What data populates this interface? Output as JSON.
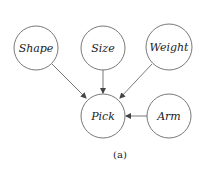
{
  "diagram": {
    "type": "bayesian-network",
    "nodes": [
      {
        "id": "shape",
        "label": "Shape",
        "cx": 36,
        "cy": 48,
        "r": 22
      },
      {
        "id": "size",
        "label": "Size",
        "cx": 103,
        "cy": 48,
        "r": 22
      },
      {
        "id": "weight",
        "label": "Weight",
        "cx": 169,
        "cy": 47,
        "r": 23
      },
      {
        "id": "pick",
        "label": "Pick",
        "cx": 103,
        "cy": 116,
        "r": 22
      },
      {
        "id": "arm",
        "label": "Arm",
        "cx": 169,
        "cy": 116,
        "r": 22
      }
    ],
    "edges": [
      {
        "from": "shape",
        "to": "pick"
      },
      {
        "from": "size",
        "to": "pick"
      },
      {
        "from": "weight",
        "to": "pick"
      },
      {
        "from": "arm",
        "to": "pick"
      }
    ],
    "caption": "(a)",
    "colors": {
      "stroke": "#555555",
      "text": "#222222",
      "background": "#ffffff"
    }
  }
}
